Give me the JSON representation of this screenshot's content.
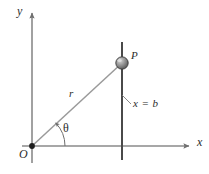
{
  "figure": {
    "canvas": {
      "width": 209,
      "height": 174,
      "background": "#ffffff"
    },
    "colors": {
      "axis": "#8a8a8a",
      "ray": "#9a9a9a",
      "vertical_line": "#4a4a4a",
      "point_fill": "#8f8f8f",
      "point_stroke": "#3a3a3a",
      "label_text": "#2b2b2b",
      "arc": "#6e6e6e"
    },
    "labels": {
      "y_axis": "y",
      "x_axis": "x",
      "origin": "O",
      "point": "P",
      "radius": "r",
      "angle": "θ",
      "line_equation": "x = b"
    },
    "geometry": {
      "origin": {
        "x": 32,
        "y": 146
      },
      "point_p": {
        "x": 122,
        "y": 63
      },
      "vertical_line_x": 122,
      "vertical_line_top_y": 42,
      "vertical_line_bottom_y": 160,
      "x_axis_y": 146,
      "x_axis_start_x": 22,
      "x_axis_end_x": 193,
      "y_axis_x": 32,
      "y_axis_top_y": 9,
      "y_axis_bottom_y": 163,
      "angle_arc_radius": 33,
      "point_radius": 6.2
    }
  }
}
